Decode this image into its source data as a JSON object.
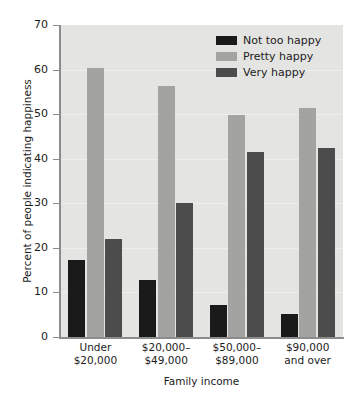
{
  "chart_data": {
    "type": "bar",
    "title": "",
    "subtitle": "",
    "xlabel": "Family income",
    "ylabel": "Percent of people indicating happiness",
    "categories": [
      "Under\n$20,000",
      "$20,000–\n$49,000",
      "$50,000–\n$89,000",
      "$90,000\nand over"
    ],
    "category_lines": [
      [
        "Under",
        "$20,000"
      ],
      [
        "$20,000–",
        "$49,000"
      ],
      [
        "$50,000–",
        "$89,000"
      ],
      [
        "$90,000",
        "and over"
      ]
    ],
    "series": [
      {
        "name": "Not too happy",
        "color": "#1a1a1a",
        "values": [
          17.3,
          12.8,
          7.2,
          5.1
        ]
      },
      {
        "name": "Pretty happy",
        "color": "#a3a3a1",
        "values": [
          60.4,
          56.4,
          49.9,
          51.3
        ]
      },
      {
        "name": "Very happy",
        "color": "#4c4c4c",
        "values": [
          22.1,
          30.1,
          41.4,
          42.4
        ]
      }
    ],
    "ylim": [
      0,
      70
    ],
    "yticks": [
      0,
      10,
      20,
      30,
      40,
      50,
      60,
      70
    ],
    "ytick_labels": [
      "0",
      "10",
      "20",
      "30",
      "40",
      "50",
      "60",
      "70"
    ],
    "grid": true,
    "grid_axis": "y",
    "legend_position": "top-right",
    "plot_background": "#e4e4e2"
  },
  "legend": {
    "items": [
      {
        "label": "Not too happy",
        "color": "#1a1a1a"
      },
      {
        "label": "Pretty happy",
        "color": "#a3a3a1"
      },
      {
        "label": "Very happy",
        "color": "#4c4c4c"
      }
    ]
  },
  "artifact": {
    "bottom_text": ""
  }
}
